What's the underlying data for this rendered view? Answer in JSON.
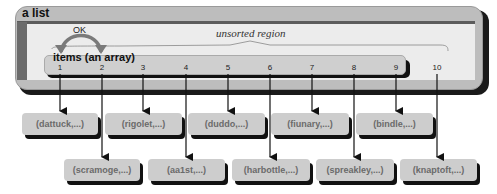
{
  "diagram": {
    "container_title": "a list",
    "region_label": "unsorted region",
    "array_label": "items (an array)",
    "swap_label": "OK",
    "indices": [
      "1",
      "2",
      "3",
      "4",
      "5",
      "6",
      "7",
      "8",
      "9",
      "10"
    ],
    "top_row": [
      {
        "index": "1",
        "label": "(dattuck,...)"
      },
      {
        "index": "3",
        "label": "(rigolet,...)"
      },
      {
        "index": "5",
        "label": "(duddo,...)"
      },
      {
        "index": "7",
        "label": "(fiunary,...)"
      },
      {
        "index": "9",
        "label": "(bindle,...)"
      }
    ],
    "bottom_row": [
      {
        "index": "2",
        "label": "(scramoge,...)"
      },
      {
        "index": "4",
        "label": "(aa1st,...)"
      },
      {
        "index": "6",
        "label": "(harbottle,...)"
      },
      {
        "index": "8",
        "label": "(spreakley,...)"
      },
      {
        "index": "10",
        "label": "(knaptoft,...)"
      }
    ],
    "colors": {
      "container_fill": "#bdbdbd",
      "inner_fill": "#ececec",
      "node_fill": "#cdcdcd",
      "node_text": "#6a6a6a",
      "shadow": "#111111",
      "swap_arrow": "#7a7a7a"
    }
  }
}
